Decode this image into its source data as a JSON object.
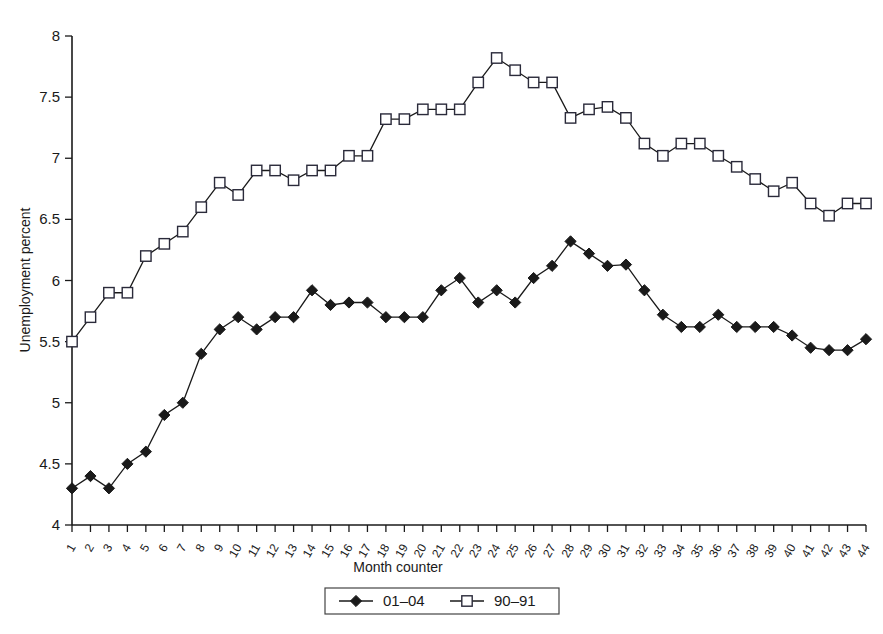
{
  "chart_data": {
    "type": "line",
    "title": "",
    "xlabel": "Month counter",
    "ylabel": "Unemployment percent",
    "xlim": [
      1,
      44
    ],
    "ylim": [
      4,
      8
    ],
    "ytick_labels": [
      "8",
      "7.5",
      "7",
      "6.5",
      "6",
      "5.5",
      "5",
      "4.5",
      "4"
    ],
    "ytick_values": [
      8,
      7.5,
      7,
      6.5,
      6,
      5.5,
      5,
      4.5,
      4
    ],
    "grid": false,
    "legend_position": "bottom-center",
    "x": [
      1,
      2,
      3,
      4,
      5,
      6,
      7,
      8,
      9,
      10,
      11,
      12,
      13,
      14,
      15,
      16,
      17,
      18,
      19,
      20,
      21,
      22,
      23,
      24,
      25,
      26,
      27,
      28,
      29,
      30,
      31,
      32,
      33,
      34,
      35,
      36,
      37,
      38,
      39,
      40,
      41,
      42,
      43,
      44
    ],
    "xtick_labels": [
      "1",
      "2",
      "3",
      "4",
      "5",
      "6",
      "7",
      "8",
      "9",
      "10",
      "11",
      "12",
      "13",
      "14",
      "15",
      "16",
      "17",
      "18",
      "19",
      "20",
      "21",
      "22",
      "23",
      "24",
      "25",
      "26",
      "27",
      "28",
      "29",
      "30",
      "31",
      "32",
      "33",
      "34",
      "35",
      "36",
      "37",
      "38",
      "39",
      "40",
      "41",
      "42",
      "43",
      "44"
    ],
    "series": [
      {
        "name": "01–04",
        "marker": "filled-diamond",
        "color": "#1a1a1a",
        "values": [
          4.3,
          4.4,
          4.3,
          4.5,
          4.6,
          4.9,
          5.0,
          5.4,
          5.6,
          5.7,
          5.6,
          5.7,
          5.7,
          5.92,
          5.8,
          5.82,
          5.82,
          5.7,
          5.7,
          5.7,
          5.92,
          6.02,
          5.82,
          5.92,
          5.82,
          6.02,
          6.12,
          6.32,
          6.22,
          6.12,
          6.13,
          5.92,
          5.72,
          5.62,
          5.62,
          5.72,
          5.62,
          5.62,
          5.62,
          5.55,
          5.45,
          5.43,
          5.43,
          5.52
        ]
      },
      {
        "name": "90–91",
        "marker": "open-square",
        "color": "#2a2a3a",
        "values": [
          5.5,
          5.7,
          5.9,
          5.9,
          6.2,
          6.3,
          6.4,
          6.6,
          6.8,
          6.7,
          6.9,
          6.9,
          6.82,
          6.9,
          6.9,
          7.02,
          7.02,
          7.32,
          7.32,
          7.4,
          7.4,
          7.4,
          7.62,
          7.82,
          7.72,
          7.62,
          7.62,
          7.33,
          7.4,
          7.42,
          7.33,
          7.12,
          7.02,
          7.12,
          7.12,
          7.02,
          6.93,
          6.83,
          6.73,
          6.8,
          6.63,
          6.53,
          6.63,
          6.63
        ]
      }
    ]
  },
  "legend": {
    "entries": [
      {
        "label": "01–04",
        "marker": "filled-diamond"
      },
      {
        "label": "90–91",
        "marker": "open-square"
      }
    ]
  }
}
